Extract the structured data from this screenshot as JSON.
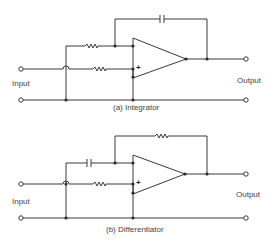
{
  "integrator": {
    "caption": "(a) Integrator",
    "input_label": "Input",
    "output_label": "Output",
    "plus_sign": "+",
    "feedback_component": "capacitor",
    "series_component": "resistor"
  },
  "differentiator": {
    "caption": "(b) Differentiator",
    "input_label": "Input",
    "output_label": "Output",
    "plus_sign": "+",
    "feedback_component": "resistor",
    "series_component": "capacitor"
  },
  "colors": {
    "wire": "#3a3a3a",
    "text": "#444444",
    "background": "#ffffff"
  }
}
